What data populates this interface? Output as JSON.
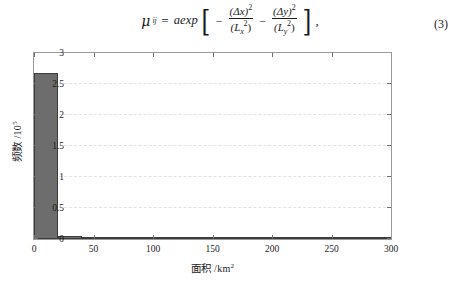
{
  "equation": {
    "lhs_symbol": "μ",
    "lhs_subscript": "ij",
    "equals": "=",
    "function": "aexp",
    "bracket_open": "[",
    "bracket_close": "]",
    "minus1": "−",
    "term1_numerator": "(Δx)",
    "term1_num_sup": "2",
    "term1_denominator": "(L",
    "term1_den_sub": "x",
    "term1_den_sup": "2",
    "term1_den_close": ")",
    "minus2": "−",
    "term2_numerator": "(Δy)",
    "term2_num_sup": "2",
    "term2_denominator": "(L",
    "term2_den_sub": "y",
    "term2_den_sup": "2",
    "term2_den_close": ")",
    "trailing_comma": ",",
    "number": "(3)"
  },
  "chart_data": {
    "type": "bar",
    "title": "",
    "xlabel_cn": "面积",
    "xlabel_unit": "/km",
    "xlabel_unit_sup": "2",
    "ylabel_cn": "频数",
    "ylabel_unit": "/10",
    "ylabel_unit_sup": "5",
    "xlim": [
      0,
      300
    ],
    "ylim": [
      0,
      3
    ],
    "xticks": [
      0,
      50,
      100,
      150,
      200,
      250,
      300
    ],
    "xtick_labels": [
      "0",
      "50",
      "100",
      "150",
      "200",
      "250",
      "300"
    ],
    "yticks": [
      0,
      0.5,
      1,
      1.5,
      2,
      2.5,
      3
    ],
    "ytick_labels": [
      "0",
      "0.5",
      "1",
      "1.5",
      "2",
      "2.5",
      "3"
    ],
    "grid": true,
    "grid_axis": "y",
    "bar_color": "#6d6d6d",
    "bar_edge_color": "#3c3c3c",
    "bin_width": 20,
    "bin_starts": [
      0,
      20,
      40,
      60,
      80,
      100,
      120,
      140,
      160,
      180,
      200,
      220,
      240,
      260,
      280
    ],
    "values": [
      2.68,
      0.055,
      0.016,
      0.012,
      0.008,
      0.006,
      0.005,
      0.004,
      0.003,
      0.002,
      0.002,
      0.002,
      0.001,
      0.001,
      0.004
    ]
  }
}
